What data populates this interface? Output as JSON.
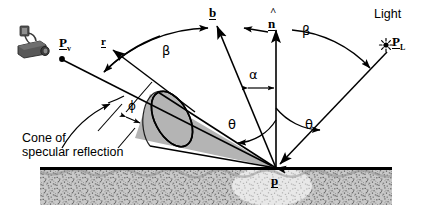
{
  "figure": {
    "background_color": "#ffffff",
    "width": 431,
    "height": 223
  },
  "labels": {
    "viewer_point": "P",
    "viewer_point_subscript": "v",
    "light_point": "P",
    "light_point_subscript": "L",
    "light_word": "Light",
    "bisector_vector": "b",
    "normal_vector": "n",
    "normal_hat": "^",
    "reflection_vector": "r",
    "surface_point": "p",
    "alpha": "α",
    "beta_left": "β",
    "beta_right": "β",
    "phi": "ϕ",
    "theta_left": "θ",
    "theta_right": "θ",
    "caption_line1": "Cone of",
    "caption_line2": "specular reflection"
  },
  "icons": {
    "camera": "camera-icon",
    "light_source": "light-star-icon"
  },
  "colors": {
    "stroke": "#000000",
    "cone_fill": "#b4b4b4",
    "ground_dark": "#8a8a8a",
    "ground_light": "#d8d8d8",
    "camera_body": "#4d4d4d",
    "camera_light": "#9a9a9a"
  },
  "geometry": {
    "surface_point_xy": [
      276,
      168
    ],
    "ground_line_y": 168,
    "normal_tip_xy": [
      276,
      28
    ],
    "b_tip_xy": [
      215,
      22
    ],
    "r_tip_xy": [
      110,
      46
    ],
    "viewer_dot_xy": [
      60,
      55
    ],
    "light_dot_xy": [
      393,
      43
    ],
    "cone_axis_half_angle_deg": 12
  }
}
